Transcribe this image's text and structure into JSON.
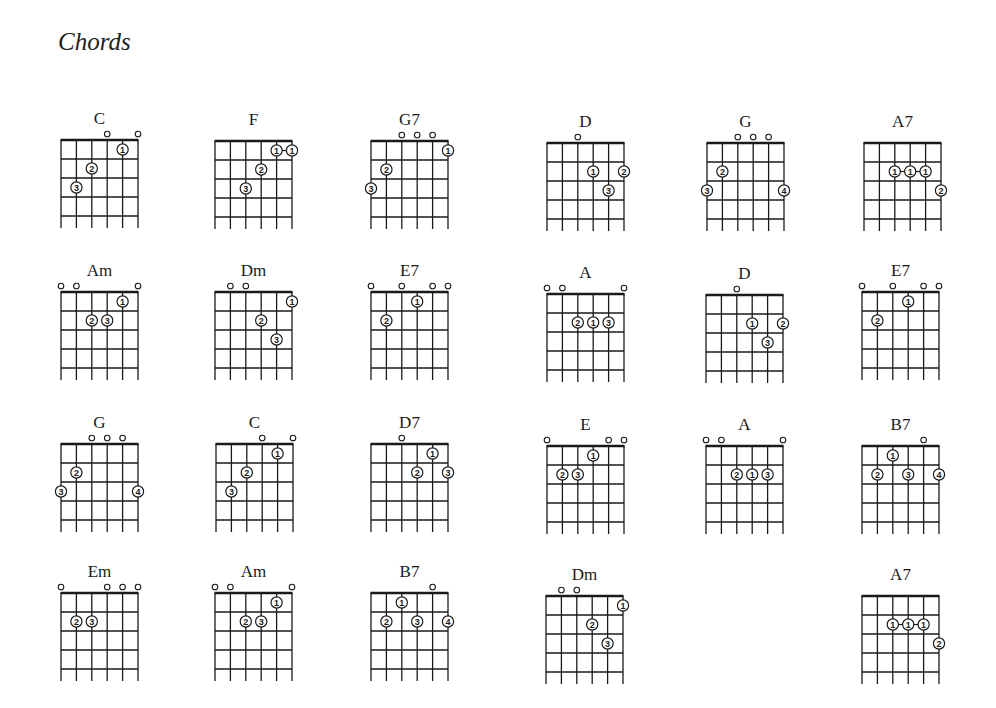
{
  "page": {
    "title": "Chords"
  },
  "diagram_geometry": {
    "strings": 6,
    "frets": 4,
    "string_spacing": 15.4,
    "fret_spacing": 19
  },
  "chords": [
    {
      "name": "C",
      "x": 61,
      "y": 140,
      "open": [
        3,
        5
      ],
      "dots": [
        [
          4,
          1,
          1
        ],
        [
          2,
          2,
          2
        ],
        [
          1,
          3,
          3
        ]
      ]
    },
    {
      "name": "F",
      "x": 215,
      "y": 141,
      "open": [],
      "dots": [
        [
          4,
          1,
          1
        ],
        [
          5,
          1,
          1
        ],
        [
          3,
          2,
          2
        ],
        [
          2,
          3,
          3
        ]
      ],
      "links": [
        [
          0,
          1
        ]
      ]
    },
    {
      "name": "G7",
      "x": 371,
      "y": 141,
      "open": [
        2,
        3,
        4
      ],
      "dots": [
        [
          5,
          1,
          1
        ],
        [
          1,
          2,
          2
        ],
        [
          0,
          3,
          3
        ]
      ]
    },
    {
      "name": "D",
      "x": 547,
      "y": 143,
      "open": [
        2
      ],
      "dots": [
        [
          3,
          2,
          1
        ],
        [
          5,
          2,
          2
        ],
        [
          4,
          3,
          3
        ]
      ]
    },
    {
      "name": "G",
      "x": 707,
      "y": 143,
      "open": [
        2,
        3,
        4
      ],
      "dots": [
        [
          1,
          2,
          2
        ],
        [
          0,
          3,
          3
        ],
        [
          5,
          3,
          4
        ]
      ]
    },
    {
      "name": "A7",
      "x": 864,
      "y": 143,
      "open": [],
      "dots": [
        [
          2,
          2,
          1
        ],
        [
          3,
          2,
          1
        ],
        [
          4,
          2,
          1
        ],
        [
          5,
          3,
          2
        ]
      ],
      "links": [
        [
          0,
          1
        ],
        [
          1,
          2
        ]
      ]
    },
    {
      "name": "Am",
      "x": 61,
      "y": 292,
      "open": [
        0,
        1,
        5
      ],
      "dots": [
        [
          4,
          1,
          1
        ],
        [
          2,
          2,
          2
        ],
        [
          3,
          2,
          3
        ]
      ]
    },
    {
      "name": "Dm",
      "x": 215,
      "y": 292,
      "open": [
        1,
        2
      ],
      "dots": [
        [
          5,
          1,
          1
        ],
        [
          3,
          2,
          2
        ],
        [
          4,
          3,
          3
        ]
      ]
    },
    {
      "name": "E7",
      "x": 371,
      "y": 292,
      "open": [
        0,
        2,
        4,
        5
      ],
      "dots": [
        [
          3,
          1,
          1
        ],
        [
          1,
          2,
          2
        ]
      ]
    },
    {
      "name": "A",
      "x": 547,
      "y": 294,
      "open": [
        0,
        1,
        5
      ],
      "dots": [
        [
          2,
          2,
          2
        ],
        [
          3,
          2,
          1
        ],
        [
          4,
          2,
          3
        ]
      ]
    },
    {
      "name": "D",
      "x": 706,
      "y": 295,
      "open": [
        2
      ],
      "dots": [
        [
          3,
          2,
          1
        ],
        [
          5,
          2,
          2
        ],
        [
          4,
          3,
          3
        ]
      ]
    },
    {
      "name": "E7",
      "x": 862,
      "y": 292,
      "open": [
        0,
        2,
        4,
        5
      ],
      "dots": [
        [
          3,
          1,
          1
        ],
        [
          1,
          2,
          2
        ]
      ]
    },
    {
      "name": "G",
      "x": 61,
      "y": 444,
      "open": [
        2,
        3,
        4
      ],
      "dots": [
        [
          1,
          2,
          2
        ],
        [
          0,
          3,
          3
        ],
        [
          5,
          3,
          4
        ]
      ]
    },
    {
      "name": "C",
      "x": 216,
      "y": 444,
      "open": [
        3,
        5
      ],
      "dots": [
        [
          4,
          1,
          1
        ],
        [
          2,
          2,
          2
        ],
        [
          1,
          3,
          3
        ]
      ]
    },
    {
      "name": "D7",
      "x": 371,
      "y": 444,
      "open": [
        2
      ],
      "dots": [
        [
          4,
          1,
          1
        ],
        [
          3,
          2,
          2
        ],
        [
          5,
          2,
          3
        ]
      ]
    },
    {
      "name": "E",
      "x": 547,
      "y": 446,
      "open": [
        0,
        4,
        5
      ],
      "dots": [
        [
          3,
          1,
          1
        ],
        [
          1,
          2,
          2
        ],
        [
          2,
          2,
          3
        ]
      ]
    },
    {
      "name": "A",
      "x": 706,
      "y": 446,
      "open": [
        0,
        1,
        5
      ],
      "dots": [
        [
          2,
          2,
          2
        ],
        [
          3,
          2,
          1
        ],
        [
          4,
          2,
          3
        ]
      ]
    },
    {
      "name": "B7",
      "x": 862,
      "y": 446,
      "open": [
        4
      ],
      "dots": [
        [
          2,
          1,
          1
        ],
        [
          1,
          2,
          2
        ],
        [
          3,
          2,
          3
        ],
        [
          5,
          2,
          4
        ]
      ]
    },
    {
      "name": "Em",
      "x": 61,
      "y": 593,
      "open": [
        0,
        3,
        4,
        5
      ],
      "dots": [
        [
          1,
          2,
          2
        ],
        [
          2,
          2,
          3
        ]
      ]
    },
    {
      "name": "Am",
      "x": 215,
      "y": 593,
      "open": [
        0,
        1,
        5
      ],
      "dots": [
        [
          4,
          1,
          1
        ],
        [
          2,
          2,
          2
        ],
        [
          3,
          2,
          3
        ]
      ]
    },
    {
      "name": "B7",
      "x": 371,
      "y": 593,
      "open": [
        4
      ],
      "dots": [
        [
          2,
          1,
          1
        ],
        [
          1,
          2,
          2
        ],
        [
          3,
          2,
          3
        ],
        [
          5,
          2,
          4
        ]
      ]
    },
    {
      "name": "Dm",
      "x": 546,
      "y": 596,
      "open": [
        1,
        2
      ],
      "dots": [
        [
          5,
          1,
          1
        ],
        [
          3,
          2,
          2
        ],
        [
          4,
          3,
          3
        ]
      ]
    },
    {
      "name": "A7",
      "x": 862,
      "y": 596,
      "open": [],
      "dots": [
        [
          2,
          2,
          1
        ],
        [
          3,
          2,
          1
        ],
        [
          4,
          2,
          1
        ],
        [
          5,
          3,
          2
        ]
      ],
      "links": [
        [
          0,
          1
        ],
        [
          1,
          2
        ]
      ]
    }
  ],
  "colors": {
    "ink": "#1a1a1a",
    "paper": "#ffffff"
  }
}
